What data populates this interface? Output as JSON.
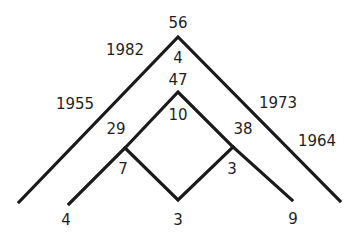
{
  "diagram": {
    "type": "nested-chevron-number-tree",
    "line_color": "#1a1a1a",
    "text_color": "#1f1f1f",
    "labels": {
      "outer_apex_top": "56",
      "outer_apex_inside": "4",
      "outer_left_upper": "1982",
      "outer_left_lower": "1955",
      "outer_right_upper": "1973",
      "outer_right_lower": "1964",
      "inner_apex_top": "47",
      "inner_apex_inside": "10",
      "left_junction_top": "29",
      "left_junction_inside": "7",
      "right_junction_top": "38",
      "right_junction_inside": "3",
      "bottom_left": "4",
      "bottom_center": "3",
      "bottom_right": "9"
    }
  }
}
